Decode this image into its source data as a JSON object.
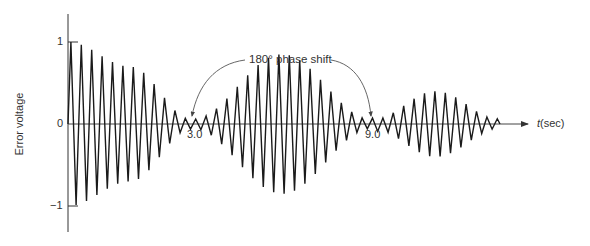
{
  "chart_data": {
    "type": "line",
    "title": "",
    "xlabel": "t(sec)",
    "ylabel": "Error voltage",
    "ylim": [
      -1,
      1
    ],
    "yticks": [
      {
        "value": 1,
        "label": "1"
      },
      {
        "value": 0,
        "label": "0"
      },
      {
        "value": -1,
        "label": "-1"
      }
    ],
    "xticks": [
      {
        "value": 3.0,
        "label": "3.0"
      },
      {
        "value": 9.0,
        "label": "9.0"
      }
    ],
    "grid": false,
    "annotations": [
      {
        "text": "180° phase shift",
        "points_to": [
          3.0,
          9.0
        ]
      }
    ],
    "series": [
      {
        "name": "Error voltage",
        "description": "Oscillating signal with beating envelope; amplitude decays from 1 to ~0 at t=3.0, grows to ~0.85 near t=6, returns to ~0 at t=9.0, then a smaller lobe ~0.4 peak; 180° phase shift at each null",
        "envelope": [
          {
            "t": 0,
            "amp": 1.0
          },
          {
            "t": 1.5,
            "amp": 0.7
          },
          {
            "t": 3.0,
            "amp": 0.05
          },
          {
            "t": 6.0,
            "amp": 0.85
          },
          {
            "t": 9.0,
            "amp": 0.05
          },
          {
            "t": 11.0,
            "amp": 0.4
          },
          {
            "t": 13.0,
            "amp": 0.05
          }
        ],
        "cycles_per_sec": 4
      }
    ]
  },
  "labels": {
    "ylabel": "Error voltage",
    "xlabel": "t(sec)",
    "ytick_pos": "1",
    "ytick_zero": "0",
    "ytick_neg": "−1",
    "xtick_3": "3.0",
    "xtick_9": "9.0",
    "annotation": "180° phase shift"
  }
}
